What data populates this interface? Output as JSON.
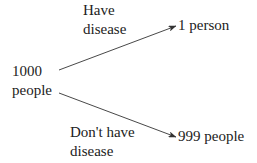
{
  "diagram": {
    "type": "tree",
    "root": {
      "line1": "1000",
      "line2": "people"
    },
    "branches": [
      {
        "edge_label_line1": "Have",
        "edge_label_line2": "disease",
        "target": "1 person"
      },
      {
        "edge_label_line1": "Don't have",
        "edge_label_line2": "disease",
        "target": "999 people"
      }
    ],
    "colors": {
      "text": "#222222",
      "arrow": "#333333",
      "background": "#ffffff"
    }
  }
}
